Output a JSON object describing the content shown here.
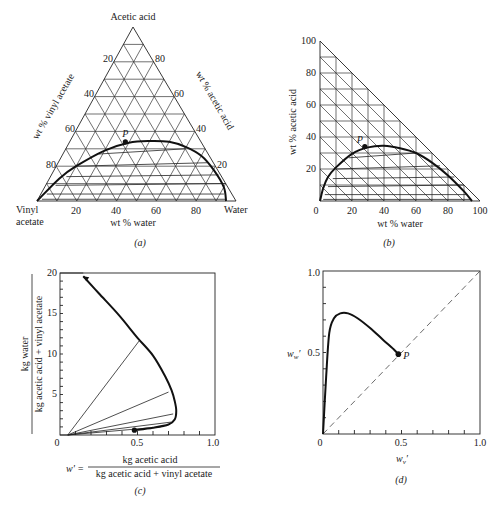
{
  "chart_data": [
    {
      "panel": "a",
      "type": "ternary",
      "caption": "(a)",
      "apex_labels": {
        "top": "Acetic acid",
        "left": [
          "Vinyl",
          "acetate"
        ],
        "right": "Water"
      },
      "axis_labels": {
        "left": "wt % vinyl acetate",
        "right": "wt % acetic acid",
        "bottom": "wt % water"
      },
      "left_ticks": [
        "20",
        "40",
        "60",
        "80"
      ],
      "right_ticks": [
        "80",
        "60",
        "40",
        "20"
      ],
      "bottom_ticks": [
        "20",
        "40",
        "60",
        "80"
      ],
      "grid_step": 10,
      "point_label": "P",
      "binodal_curve": {
        "x_water": [
          0,
          5,
          10,
          20,
          30,
          40,
          50,
          60,
          70,
          80,
          90,
          95
        ],
        "y_acetic": [
          0,
          13,
          20,
          29,
          33.5,
          34.5,
          34,
          31,
          26,
          18,
          8,
          0
        ]
      },
      "point_P": {
        "water": 28,
        "acetic": 34
      }
    },
    {
      "panel": "b",
      "type": "right-triangle",
      "caption": "(b)",
      "xlabel": "wt % water",
      "ylabel": "wt % acetic acid",
      "xticks": [
        "0",
        "20",
        "40",
        "60",
        "80",
        "100"
      ],
      "yticks": [
        "20",
        "40",
        "60",
        "80",
        "100"
      ],
      "xlim": [
        0,
        100
      ],
      "ylim": [
        0,
        100
      ],
      "point_label": "P",
      "binodal_curve": {
        "x": [
          0,
          2,
          5,
          10,
          20,
          30,
          40,
          50,
          60,
          70,
          80,
          90,
          95
        ],
        "y": [
          0,
          8,
          15,
          21,
          29.5,
          33.5,
          34.5,
          33,
          30,
          24,
          16,
          6,
          0
        ]
      },
      "point_P": {
        "x": 28,
        "y": 34
      },
      "tie_lines": [
        {
          "x1": 2,
          "y1": 1,
          "x2": 94,
          "y2": 1
        },
        {
          "x1": 3,
          "y1": 4,
          "x2": 92,
          "y2": 4
        },
        {
          "x1": 5,
          "y1": 9,
          "x2": 90,
          "y2": 10
        },
        {
          "x1": 8,
          "y1": 14,
          "x2": 84,
          "y2": 15
        },
        {
          "x1": 10,
          "y1": 20,
          "x2": 75,
          "y2": 22
        },
        {
          "x1": 18,
          "y1": 27,
          "x2": 60,
          "y2": 30
        }
      ]
    },
    {
      "panel": "c",
      "type": "line",
      "caption": "(c)",
      "ylabel_numerator": "kg water",
      "ylabel_denominator": "kg acetic acid + vinyl acetate",
      "xlabel_prefix": "w' =",
      "xlabel_numerator": "kg acetic acid",
      "xlabel_denominator": "kg acetic acid + vinyl acetate",
      "xticks": [
        "0",
        "0.5",
        "1.0"
      ],
      "yticks": [
        "5",
        "10",
        "15",
        "20"
      ],
      "xlim": [
        0,
        1
      ],
      "ylim": [
        0,
        20
      ],
      "curve": {
        "x": [
          0.48,
          0.6,
          0.7,
          0.74,
          0.75,
          0.74,
          0.72,
          0.68,
          0.6,
          0.5,
          0.38,
          0.25,
          0.15
        ],
        "y": [
          0.6,
          0.9,
          1.3,
          1.9,
          3.0,
          4.2,
          5.5,
          7.2,
          9.8,
          12.0,
          14.8,
          17.5,
          19.6
        ]
      },
      "point": {
        "x": 0.48,
        "y": 0.6
      },
      "tie_lines": [
        {
          "x1": 0.05,
          "y1": 0,
          "x2": 0.51,
          "y2": 11.6
        },
        {
          "x1": 0.05,
          "y1": 0,
          "x2": 0.7,
          "y2": 5.3
        },
        {
          "x1": 0.05,
          "y1": 0,
          "x2": 0.73,
          "y2": 2.6
        },
        {
          "x1": 0.05,
          "y1": 0,
          "x2": 0.72,
          "y2": 1.6
        },
        {
          "x1": 0.05,
          "y1": 0,
          "x2": 0.65,
          "y2": 1.0
        }
      ]
    },
    {
      "panel": "d",
      "type": "line",
      "caption": "(d)",
      "xlabel": "w_v'",
      "ylabel": "w_w'",
      "xticks": [
        "0",
        "0.5",
        "1.0"
      ],
      "yticks": [
        "0.5",
        "1.0"
      ],
      "xlim": [
        0,
        1
      ],
      "ylim": [
        0,
        1
      ],
      "point_label": "P",
      "curve": {
        "x": [
          0.0,
          0.02,
          0.04,
          0.07,
          0.11,
          0.16,
          0.22,
          0.3,
          0.38,
          0.45,
          0.48
        ],
        "y": [
          0.0,
          0.35,
          0.62,
          0.71,
          0.74,
          0.74,
          0.71,
          0.65,
          0.58,
          0.52,
          0.49
        ]
      },
      "point_P": {
        "x": 0.48,
        "y": 0.49
      },
      "diagonal": "y = x (dashed)"
    }
  ],
  "labels": {
    "a": {
      "top": "Acetic acid",
      "left1": "Vinyl",
      "left2": "acetate",
      "right": "Water",
      "leftAxis": "wt % vinyl acetate",
      "rightAxis": "wt % acetic acid",
      "bottomAxis": "wt % water",
      "caption": "(a)",
      "P": "P",
      "lt": [
        "20",
        "40",
        "60",
        "80"
      ],
      "rt": [
        "80",
        "60",
        "40",
        "20"
      ],
      "bt": [
        "20",
        "40",
        "60",
        "80"
      ]
    },
    "b": {
      "xlabel": "wt % water",
      "ylabel": "wt % acetic acid",
      "caption": "(b)",
      "P": "P",
      "xt": [
        "0",
        "20",
        "40",
        "60",
        "80",
        "100"
      ],
      "yt": [
        "20",
        "40",
        "60",
        "80",
        "100"
      ]
    },
    "c": {
      "ynum": "kg water",
      "yden": "kg acetic acid + vinyl acetate",
      "xpre": "w' =",
      "xnum": "kg acetic acid",
      "xden": "kg acetic acid + vinyl acetate",
      "caption": "(c)",
      "xt": [
        "0",
        "0.5",
        "1.0"
      ],
      "yt": [
        "5",
        "10",
        "15",
        "20"
      ]
    },
    "d": {
      "xlabel": "wv'",
      "ylabel": "ww'",
      "caption": "(d)",
      "P": "P",
      "xt": [
        "0",
        "0.5",
        "1.0"
      ],
      "yt": [
        "0.5",
        "1.0"
      ]
    }
  }
}
